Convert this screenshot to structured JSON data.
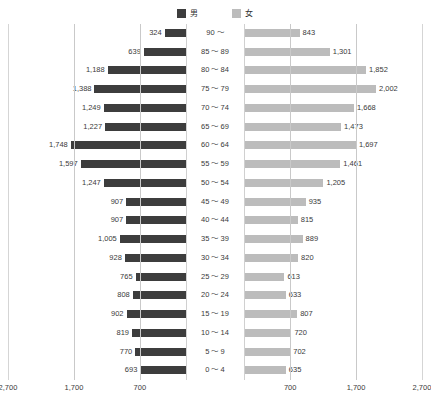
{
  "legend": {
    "entries": [
      {
        "label": "男",
        "color": "#3d3d3d",
        "icon": "square-swatch-icon"
      },
      {
        "label": "女",
        "color": "#bcbcbc",
        "icon": "square-swatch-icon"
      }
    ]
  },
  "axis": {
    "left_ticks": [
      "2,700",
      "1,700",
      "700"
    ],
    "right_ticks": [
      "700",
      "1,700",
      "2,700"
    ]
  },
  "caption": "",
  "chart_data": {
    "type": "bar",
    "subtype": "population-pyramid",
    "title": "",
    "xlabel": "",
    "ylabel": "",
    "xlim": [
      0,
      2700
    ],
    "grid": true,
    "gridlines": [
      700,
      1700,
      2700
    ],
    "legend_position": "top-center",
    "categories": [
      "90 ～",
      "85 ～ 89",
      "80 ～ 84",
      "75 ～ 79",
      "70 ～ 74",
      "65 ～ 69",
      "60 ～ 64",
      "55 ～ 59",
      "50 ～ 54",
      "45 ～ 49",
      "40 ～ 44",
      "35 ～ 39",
      "30 ～ 34",
      "25 ～ 29",
      "20 ～ 24",
      "15 ～ 19",
      "10 ～ 14",
      "5 ～ 9",
      "0 ～ 4"
    ],
    "series": [
      {
        "name": "男",
        "side": "left",
        "color": "#3d3d3d",
        "values": [
          324,
          639,
          1188,
          1388,
          1249,
          1227,
          1748,
          1597,
          1247,
          907,
          907,
          1005,
          928,
          765,
          808,
          902,
          819,
          770,
          693
        ],
        "labels": [
          "324",
          "639",
          "1,188",
          "1,388",
          "1,249",
          "1,227",
          "1,748",
          "1,597",
          "1,247",
          "907",
          "907",
          "1,005",
          "928",
          "765",
          "808",
          "902",
          "819",
          "770",
          "693"
        ]
      },
      {
        "name": "女",
        "side": "right",
        "color": "#bcbcbc",
        "values": [
          843,
          1301,
          1852,
          2002,
          1668,
          1473,
          1697,
          1461,
          1205,
          935,
          815,
          889,
          820,
          613,
          633,
          807,
          720,
          702,
          635
        ],
        "labels": [
          "843",
          "1,301",
          "1,852",
          "2,002",
          "1,668",
          "1,473",
          "1,697",
          "1,461",
          "1,205",
          "935",
          "815",
          "889",
          "820",
          "613",
          "633",
          "807",
          "720",
          "702",
          "635"
        ]
      }
    ]
  }
}
